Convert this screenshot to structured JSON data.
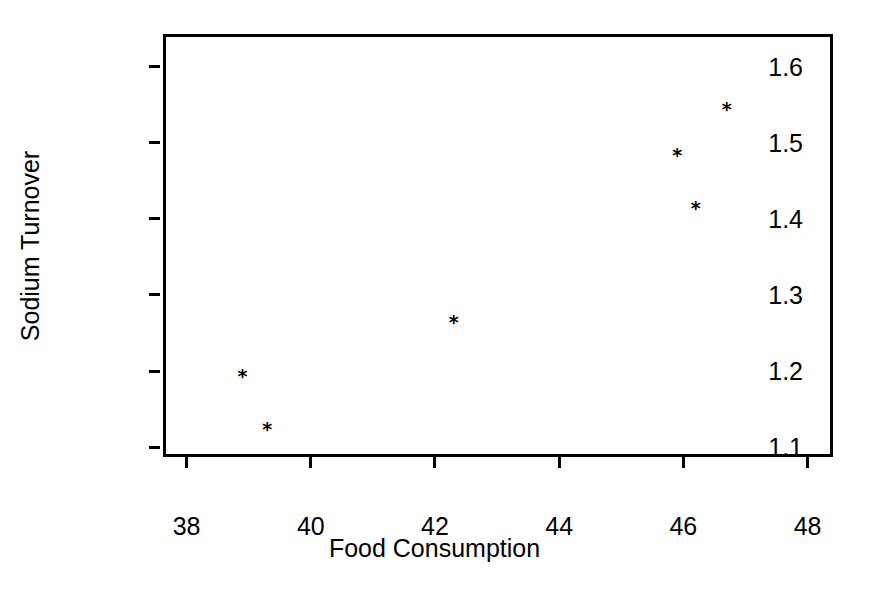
{
  "chart_data": {
    "type": "scatter",
    "title": "",
    "xlabel": "Food Consumption",
    "ylabel": "Sodium Turnover",
    "xlim": [
      37.62,
      48.41
    ],
    "ylim": [
      1.087,
      1.643
    ],
    "xticks": [
      38,
      40,
      42,
      44,
      46,
      48
    ],
    "yticks": [
      1.1,
      1.2,
      1.3,
      1.4,
      1.5,
      1.6
    ],
    "xtick_labels": [
      "38",
      "40",
      "42",
      "44",
      "46",
      "48"
    ],
    "ytick_labels": [
      "1.1",
      "1.2",
      "1.3",
      "1.4",
      "1.5",
      "1.6"
    ],
    "grid": false,
    "legend": null,
    "marker": "*",
    "marker_color": "#000000",
    "frame": "box",
    "x": [
      38.9,
      39.3,
      42.3,
      45.9,
      46.2,
      46.7
    ],
    "y": [
      1.19,
      1.12,
      1.26,
      1.48,
      1.41,
      1.54
    ],
    "points": [
      {
        "x": 38.9,
        "y": 1.19
      },
      {
        "x": 39.3,
        "y": 1.12
      },
      {
        "x": 42.3,
        "y": 1.26
      },
      {
        "x": 45.9,
        "y": 1.48
      },
      {
        "x": 46.2,
        "y": 1.41
      },
      {
        "x": 46.7,
        "y": 1.54
      }
    ]
  },
  "colors": {
    "background": "#ffffff",
    "foreground": "#000000"
  }
}
